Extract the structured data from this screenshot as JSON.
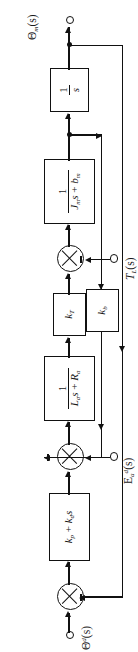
{
  "diagram": {
    "type": "control-system-block-diagram",
    "orientation": "rotated-90-ccw",
    "signals": {
      "output_theta_m": "Θ",
      "output_theta_m_sub": "m",
      "output_theta_m_arg": "(s)",
      "input_theta_d": "Θ",
      "input_theta_d_sup": "d",
      "input_theta_d_arg": "(s)",
      "disturbance_torque": "T",
      "disturbance_torque_sub": "L",
      "disturbance_torque_arg": "(s)",
      "input_ea_d": "E",
      "input_ea_d_sub": "a",
      "input_ea_d_sup": "d",
      "input_ea_d_arg": "(s)"
    },
    "blocks": [
      {
        "id": "controller",
        "label": "k_p + k_d s",
        "num": "",
        "den": "",
        "kind": "polynomial",
        "text_p": "k",
        "text_p_sub": "p",
        "text_d": "k",
        "text_d_sub": "d",
        "text_s": "s",
        "plus": "+"
      },
      {
        "id": "armature",
        "kind": "fraction",
        "num": "1",
        "den_L": "L",
        "den_L_sub": "a",
        "den_s": "s",
        "den_plus": "+",
        "den_R": "R",
        "den_R_sub": "a",
        "label": "1/(L_a s + R_a)"
      },
      {
        "id": "torque-constant",
        "kind": "gain",
        "text": "k",
        "text_sub": "T",
        "label": "k_T"
      },
      {
        "id": "inertia",
        "kind": "fraction",
        "num": "1",
        "den_J": "J",
        "den_J_sub": "m",
        "den_s": "s",
        "den_plus": "+",
        "den_b": "b",
        "den_b_sub": "m",
        "label": "1/(J_m s + b_m)"
      },
      {
        "id": "integrator",
        "kind": "fraction",
        "num": "1",
        "den_s": "s",
        "label": "1/s"
      },
      {
        "id": "back-emf",
        "kind": "gain",
        "text": "k",
        "text_sub": "b",
        "label": "k_b"
      }
    ],
    "summing_junctions": [
      {
        "id": "position-error-sum",
        "negative_port": "feedback"
      },
      {
        "id": "back-emf-sum",
        "negative_port": "feedback"
      },
      {
        "id": "load-torque-sum",
        "negative_port": "disturbance"
      }
    ],
    "colors": {
      "line": "#111111",
      "background": "#ffffff"
    }
  }
}
